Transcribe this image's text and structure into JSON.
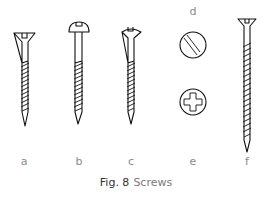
{
  "figure": {
    "number_label": "Fig. 8",
    "title": "Screws",
    "stroke_color": "#111111",
    "label_color": "#8a8a8a"
  },
  "screws": [
    {
      "id": "a",
      "label": "a",
      "type": "countersunk slotted wood screw"
    },
    {
      "id": "b",
      "label": "b",
      "type": "round head slotted wood screw"
    },
    {
      "id": "c",
      "label": "c",
      "type": "raised countersunk slotted wood screw"
    },
    {
      "id": "d",
      "label": "d",
      "type": "slotted head (top view)"
    },
    {
      "id": "e",
      "label": "e",
      "type": "cross/Phillips head (top view)"
    },
    {
      "id": "f",
      "label": "f",
      "type": "long countersunk slotted screw"
    }
  ]
}
